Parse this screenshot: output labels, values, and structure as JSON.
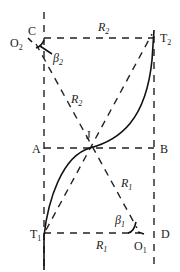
{
  "diagram": {
    "points": {
      "C": "C",
      "O2": {
        "base": "O",
        "sub": "2"
      },
      "T2": {
        "base": "T",
        "sub": "2"
      },
      "A": "A",
      "B": "B",
      "J": "J",
      "T1": {
        "base": "T",
        "sub": "1"
      },
      "O1": {
        "base": "O",
        "sub": "1"
      },
      "D": "D"
    },
    "radii": {
      "R2_top": {
        "base": "R",
        "sub": "2"
      },
      "R2_diag": {
        "base": "R",
        "sub": "2"
      },
      "R1_diag": {
        "base": "R",
        "sub": "1"
      },
      "R1_bottom": {
        "base": "R",
        "sub": "1"
      }
    },
    "angles": {
      "beta2": {
        "base": "β",
        "sub": "2"
      },
      "beta1": {
        "base": "β",
        "sub": "1"
      }
    }
  }
}
